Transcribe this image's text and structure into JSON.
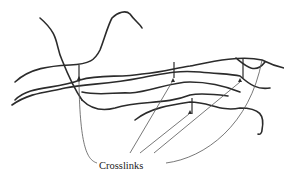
{
  "diagram": {
    "type": "polymer-crosslink-schematic",
    "label": "Crosslinks",
    "colors": {
      "chains": "#2b2b2b",
      "leader_lines": "#555555",
      "background": "#ffffff"
    }
  }
}
